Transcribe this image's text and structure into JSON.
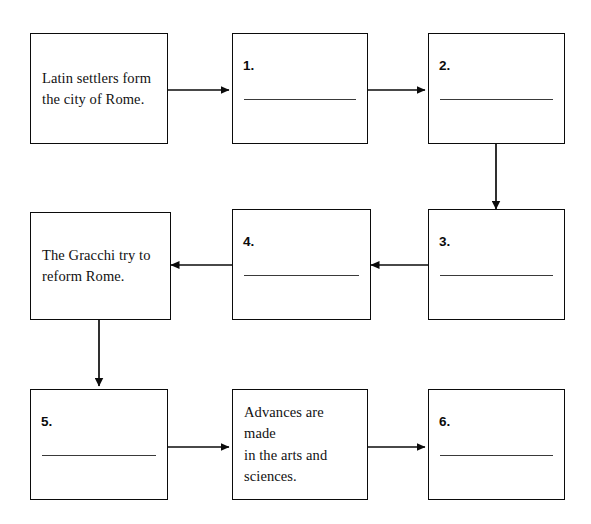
{
  "worksheet": {
    "type": "sequence-flowchart",
    "title": "",
    "nodes": [
      {
        "id": "node-rome-founded",
        "kind": "text",
        "number": "",
        "text": "Latin settlers form the city of Rome.",
        "lines": [
          "Latin settlers form",
          "the city of Rome."
        ],
        "blank": false,
        "row": 1,
        "col": 1
      },
      {
        "id": "node-blank-1",
        "kind": "blank",
        "number": "1.",
        "text": "",
        "lines": [],
        "blank": true,
        "row": 1,
        "col": 2
      },
      {
        "id": "node-blank-2",
        "kind": "blank",
        "number": "2.",
        "text": "",
        "lines": [],
        "blank": true,
        "row": 1,
        "col": 3
      },
      {
        "id": "node-gracchi",
        "kind": "text",
        "number": "",
        "text": "The Gracchi try to reform Rome.",
        "lines": [
          "The Gracchi try to",
          "reform Rome."
        ],
        "blank": false,
        "row": 2,
        "col": 1
      },
      {
        "id": "node-blank-4",
        "kind": "blank",
        "number": "4.",
        "text": "",
        "lines": [],
        "blank": true,
        "row": 2,
        "col": 2
      },
      {
        "id": "node-blank-3",
        "kind": "blank",
        "number": "3.",
        "text": "",
        "lines": [],
        "blank": true,
        "row": 2,
        "col": 3
      },
      {
        "id": "node-blank-5",
        "kind": "blank",
        "number": "5.",
        "text": "",
        "lines": [],
        "blank": true,
        "row": 3,
        "col": 1
      },
      {
        "id": "node-advances",
        "kind": "text",
        "number": "",
        "text": "Advances are made in the arts and sciences.",
        "lines": [
          "Advances are made",
          "in the arts and",
          "sciences."
        ],
        "blank": false,
        "row": 3,
        "col": 2
      },
      {
        "id": "node-blank-6",
        "kind": "blank",
        "number": "6.",
        "text": "",
        "lines": [],
        "blank": true,
        "row": 3,
        "col": 3
      }
    ],
    "connectors": [
      {
        "id": "arrow-rome-to-1",
        "from": "node-rome-founded",
        "to": "node-blank-1",
        "direction": "right"
      },
      {
        "id": "arrow-1-to-2",
        "from": "node-blank-1",
        "to": "node-blank-2",
        "direction": "right"
      },
      {
        "id": "arrow-2-to-3",
        "from": "node-blank-2",
        "to": "node-blank-3",
        "direction": "down"
      },
      {
        "id": "arrow-3-to-4",
        "from": "node-blank-3",
        "to": "node-blank-4",
        "direction": "left"
      },
      {
        "id": "arrow-4-to-gracchi",
        "from": "node-blank-4",
        "to": "node-gracchi",
        "direction": "left"
      },
      {
        "id": "arrow-gracchi-to-5",
        "from": "node-gracchi",
        "to": "node-blank-5",
        "direction": "down"
      },
      {
        "id": "arrow-5-to-advances",
        "from": "node-blank-5",
        "to": "node-advances",
        "direction": "right"
      },
      {
        "id": "arrow-advances-to-6",
        "from": "node-advances",
        "to": "node-blank-6",
        "direction": "right"
      }
    ]
  },
  "colors": {
    "ink": "#0b0b0b",
    "line": "#3a3a3a",
    "page": "#ffffff"
  }
}
